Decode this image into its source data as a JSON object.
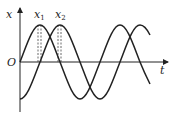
{
  "diagram": {
    "type": "two sinusoidal displacement-time graphs",
    "axes": {
      "y_label": "x",
      "x_label": "t",
      "origin_label": "O"
    },
    "markers": [
      {
        "label": "x",
        "subscript": "1",
        "description": "peak of first curve"
      },
      {
        "label": "x",
        "subscript": "2",
        "description": "peak of second curve"
      }
    ],
    "curves": [
      {
        "name": "curve-1",
        "description": "starts at origin rising, sine"
      },
      {
        "name": "curve-2",
        "description": "starts at trough, lags curve-1 by quarter period"
      }
    ],
    "colors": {
      "line": "#222222",
      "background": "#ffffff"
    }
  }
}
